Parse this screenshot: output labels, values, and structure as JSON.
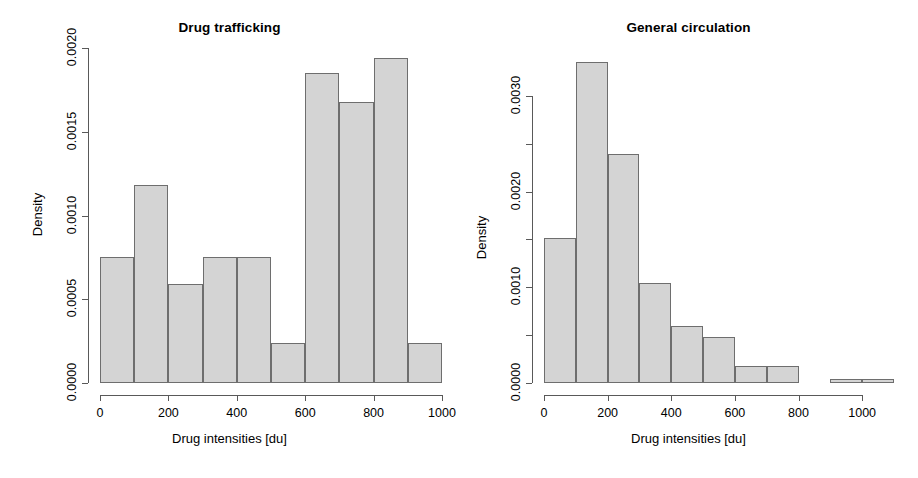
{
  "figure": {
    "background": "#ffffff",
    "bar_fill": "#d4d4d4",
    "bar_stroke": "#6e6e6e",
    "axis_color": "#595959"
  },
  "chart_data": [
    {
      "type": "bar",
      "title": "Drug trafficking",
      "xlabel": "Drug intensities [du]",
      "ylabel": "Density",
      "grid": false,
      "legend": "none",
      "bin_width": 100,
      "xlim": [
        0,
        1000
      ],
      "ylim": [
        0,
        0.002
      ],
      "xticks": [
        0,
        200,
        400,
        600,
        800,
        1000
      ],
      "xticklabels": [
        "0",
        "200",
        "400",
        "600",
        "800",
        "1000"
      ],
      "yticks": [
        0.0,
        0.0005,
        0.001,
        0.0015,
        0.002
      ],
      "yticklabels": [
        "0.0000",
        "0.0005",
        "0.0010",
        "0.0015",
        "0.0020"
      ],
      "bin_edges": [
        0,
        100,
        200,
        300,
        400,
        500,
        600,
        700,
        800,
        900,
        1000
      ],
      "categories": [
        "0-100",
        "100-200",
        "200-300",
        "300-400",
        "400-500",
        "500-600",
        "600-700",
        "700-800",
        "800-900",
        "900-1000"
      ],
      "values": [
        0.00075,
        0.00118,
        0.00059,
        0.00075,
        0.00075,
        0.00024,
        0.00185,
        0.00168,
        0.00194,
        0.00024
      ]
    },
    {
      "type": "bar",
      "title": "General circulation",
      "xlabel": "Drug intensities [du]",
      "ylabel": "Density",
      "grid": false,
      "legend": "none",
      "bin_width": 100,
      "xlim": [
        0,
        1100
      ],
      "ylim": [
        0,
        0.0035
      ],
      "xticks": [
        0,
        200,
        400,
        600,
        800,
        1000
      ],
      "xticklabels": [
        "0",
        "200",
        "400",
        "600",
        "800",
        "1000"
      ],
      "yticks": [
        0.0,
        0.0005,
        0.001,
        0.0015,
        0.002,
        0.0025,
        0.003
      ],
      "yticklabels": [
        "0.0000",
        "",
        "0.0010",
        "",
        "0.0020",
        "",
        "0.0030"
      ],
      "bin_edges": [
        0,
        100,
        200,
        300,
        400,
        500,
        600,
        700,
        800,
        900,
        1000,
        1100
      ],
      "categories": [
        "0-100",
        "100-200",
        "200-300",
        "300-400",
        "400-500",
        "500-600",
        "600-700",
        "700-800",
        "800-900",
        "900-1000",
        "1000-1100"
      ],
      "values": [
        0.00152,
        0.00335,
        0.00239,
        0.00105,
        0.0006,
        0.00048,
        0.00018,
        0.00018,
        0.0,
        4e-05,
        4e-05
      ]
    }
  ]
}
